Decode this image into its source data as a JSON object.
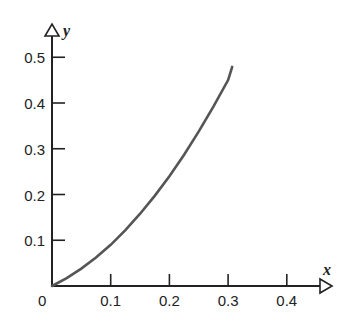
{
  "chart_data": {
    "type": "line",
    "title": "",
    "xlabel": "x",
    "ylabel": "y",
    "xlim": [
      0,
      0.45
    ],
    "ylim": [
      0,
      0.5
    ],
    "grid": false,
    "legend": null,
    "x_ticks": [
      "0.1",
      "0.2",
      "0.3",
      "0.4"
    ],
    "y_ticks": [
      "0.1",
      "0.2",
      "0.3",
      "0.4",
      "0.5"
    ],
    "origin_label": "0",
    "series": [
      {
        "name": "curve",
        "color": "#555555",
        "x": [
          0,
          0.025,
          0.05,
          0.075,
          0.1,
          0.125,
          0.15,
          0.175,
          0.2,
          0.225,
          0.25,
          0.275,
          0.3,
          0.307
        ],
        "y": [
          0,
          0.017,
          0.038,
          0.062,
          0.09,
          0.122,
          0.158,
          0.197,
          0.24,
          0.287,
          0.338,
          0.392,
          0.45,
          0.479
        ]
      }
    ]
  },
  "axes": {
    "x_name": "x",
    "y_name": "y",
    "origin": "0"
  }
}
